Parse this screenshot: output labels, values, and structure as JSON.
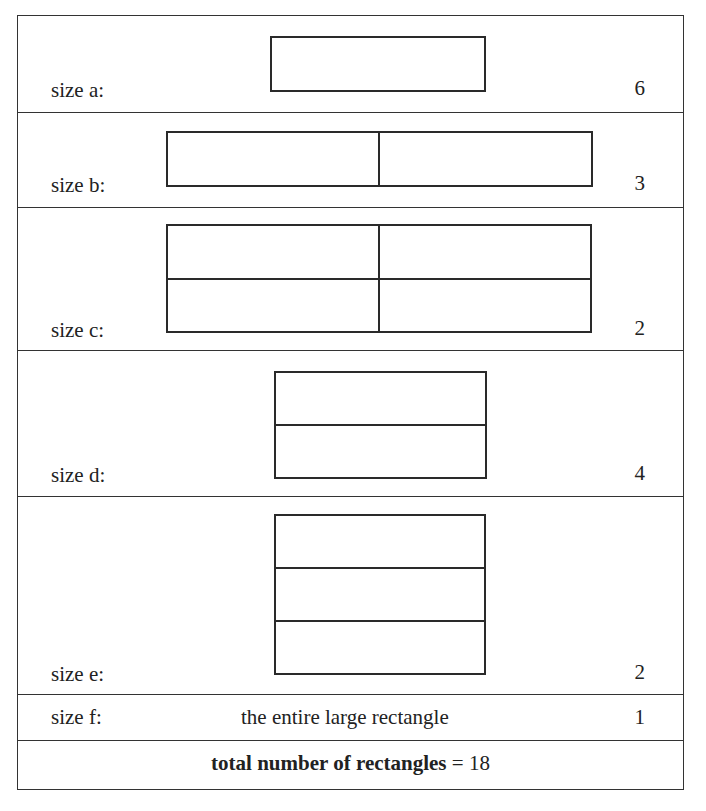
{
  "diagram": {
    "rows": [
      {
        "label": "size a:",
        "count": "6",
        "grid": {
          "cols": 1,
          "rows": 1
        }
      },
      {
        "label": "size b:",
        "count": "3",
        "grid": {
          "cols": 2,
          "rows": 1
        }
      },
      {
        "label": "size c:",
        "count": "2",
        "grid": {
          "cols": 2,
          "rows": 2
        }
      },
      {
        "label": "size d:",
        "count": "4",
        "grid": {
          "cols": 1,
          "rows": 2
        }
      },
      {
        "label": "size e:",
        "count": "2",
        "grid": {
          "cols": 1,
          "rows": 3
        }
      },
      {
        "label": "size f:",
        "description": "the entire large rectangle",
        "count": "1"
      }
    ],
    "total": {
      "label": "total number of rectangles",
      "equals": "=",
      "value": "18"
    }
  }
}
